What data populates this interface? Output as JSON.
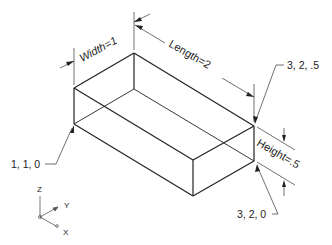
{
  "diagram": {
    "type": "isometric-box",
    "dimensions": {
      "width_label": "Width=1",
      "length_label": "Length=2",
      "height_label": "Height=.5"
    },
    "points": {
      "p1": "1, 1, 0",
      "p2": "3, 2, .5",
      "p3": "3, 2, 0"
    },
    "axes": {
      "z": "Z",
      "y": "Y",
      "x": "X"
    }
  }
}
